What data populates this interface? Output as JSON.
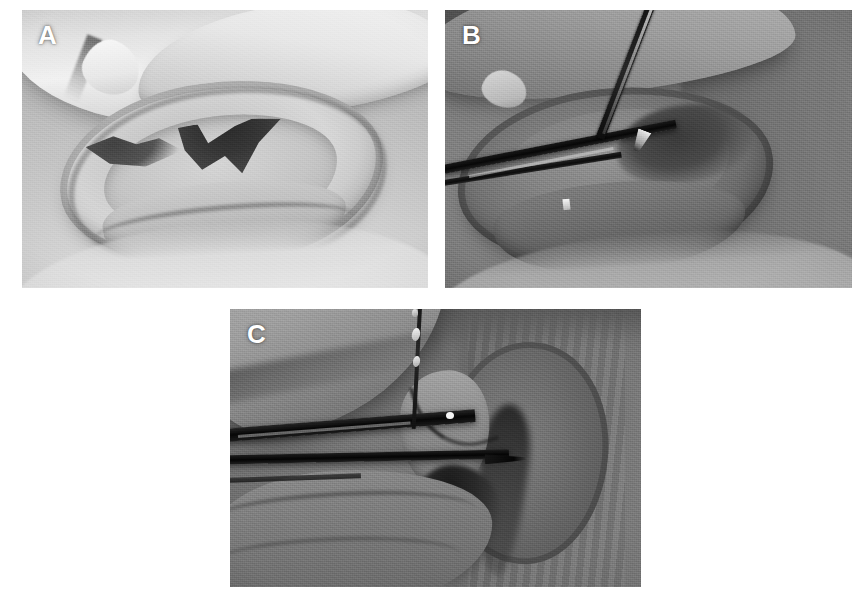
{
  "figure": {
    "kind": "clinical-photo-figure",
    "background_color": "#ffffff",
    "width": 868,
    "height": 601,
    "panel_count": 3,
    "label_color": "#ffffff"
  },
  "panels": [
    {
      "id": "A",
      "label": "A",
      "data_name": "panel-a",
      "x": 22,
      "y": 10,
      "width": 406,
      "height": 278,
      "tone": "light-gray",
      "description": "Grayscale close-up of an ear held forward by fingers, showing the helix, antihelix and a dark concha with the external auditory canal visible as a dark notch.",
      "label_position": "top-left",
      "label_x": 38,
      "label_y": 22,
      "label_size": 26,
      "instruments": []
    },
    {
      "id": "B",
      "label": "B",
      "data_name": "panel-b",
      "x": 445,
      "y": 10,
      "width": 407,
      "height": 278,
      "tone": "mid-gray",
      "description": "Grayscale intraoperative view of the same ear with a fine needle entering from the upper right and a dark forceps/scissors shaft entering horizontally from the lower left.",
      "label_position": "top-left",
      "label_x": 462,
      "label_y": 22,
      "label_size": 26,
      "instruments": [
        "needle-upper-right",
        "forceps-lower-left"
      ]
    },
    {
      "id": "C",
      "label": "C",
      "data_name": "panel-c",
      "x": 230,
      "y": 309,
      "width": 411,
      "height": 278,
      "tone": "dark-gray",
      "description": "Grayscale magnified view with two dark horizontal instrument shafts entering from the left toward the tragus, and a vertical suture thread with bright glints descending from the top of the frame.",
      "label_position": "top-left",
      "label_x": 247,
      "label_y": 321,
      "label_size": 26,
      "instruments": [
        "instrument-shaft-upper",
        "instrument-shaft-lower",
        "suture-thread-vertical"
      ]
    }
  ]
}
